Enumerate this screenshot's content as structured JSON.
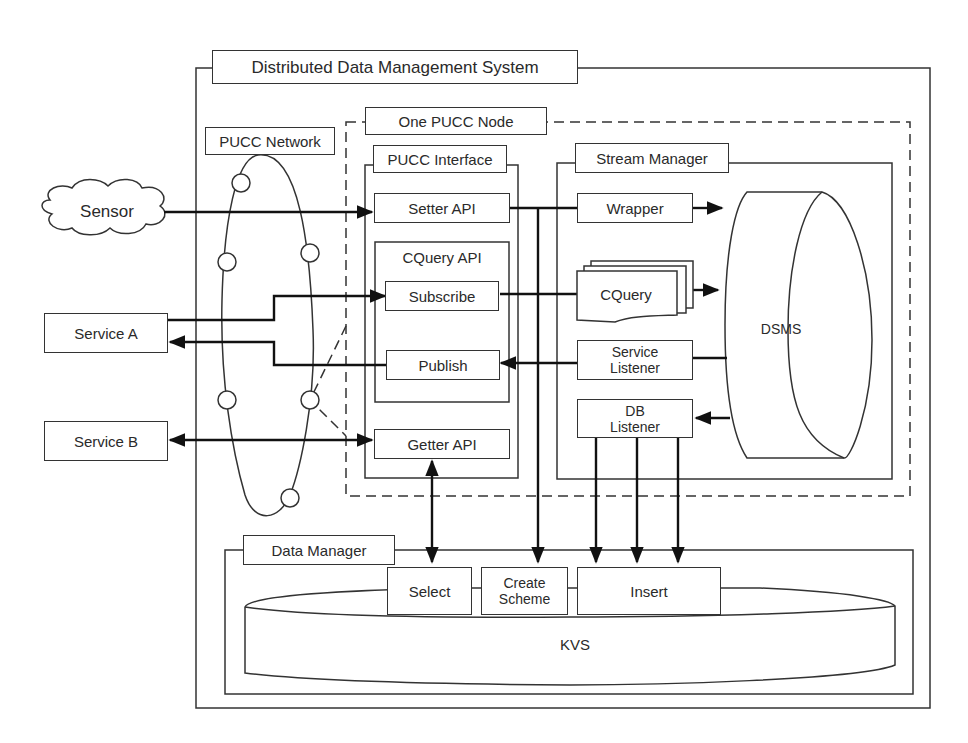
{
  "diagram": {
    "title": "Distributed Data Management System",
    "containers": {
      "system": "Distributed Data Management System",
      "pucc_node": "One PUCC Node",
      "pucc_network": "PUCC Network",
      "pucc_interface": "PUCC Interface",
      "cquery_api": "CQuery API",
      "stream_manager": "Stream Manager",
      "data_manager": "Data Manager"
    },
    "external": {
      "sensor": "Sensor",
      "service_a": "Service A",
      "service_b": "Service B"
    },
    "interface": {
      "setter_api": "Setter API",
      "subscribe": "Subscribe",
      "publish": "Publish",
      "getter_api": "Getter API"
    },
    "stream": {
      "wrapper": "Wrapper",
      "cquery": "CQuery",
      "service_listener_line1": "Service",
      "service_listener_line2": "Listener",
      "db_listener_line1": "DB",
      "db_listener_line2": "Listener",
      "dsms": "DSMS"
    },
    "data": {
      "select": "Select",
      "create_scheme_line1": "Create",
      "create_scheme_line2": "Scheme",
      "insert": "Insert",
      "kvs": "KVS"
    },
    "edges": [
      {
        "from": "Sensor",
        "to": "Setter API",
        "type": "arrow"
      },
      {
        "from": "Setter API",
        "to": "Wrapper",
        "type": "line"
      },
      {
        "from": "Setter API",
        "to": "Create Scheme",
        "type": "arrow"
      },
      {
        "from": "Wrapper",
        "to": "DSMS",
        "type": "arrow"
      },
      {
        "from": "Service A",
        "to": "Subscribe",
        "type": "arrow"
      },
      {
        "from": "Subscribe",
        "to": "CQuery",
        "type": "line"
      },
      {
        "from": "CQuery",
        "to": "DSMS",
        "type": "arrow"
      },
      {
        "from": "DSMS",
        "to": "Service Listener",
        "type": "line"
      },
      {
        "from": "Service Listener",
        "to": "Publish",
        "type": "arrow"
      },
      {
        "from": "Publish",
        "to": "Service A",
        "type": "arrow"
      },
      {
        "from": "DSMS",
        "to": "DB Listener",
        "type": "arrow"
      },
      {
        "from": "DB Listener",
        "to": "Insert",
        "type": "arrow",
        "count": 3
      },
      {
        "from": "Service B",
        "to": "Getter API",
        "type": "bidirectional"
      },
      {
        "from": "Getter API",
        "to": "Select",
        "type": "bidirectional"
      }
    ]
  }
}
